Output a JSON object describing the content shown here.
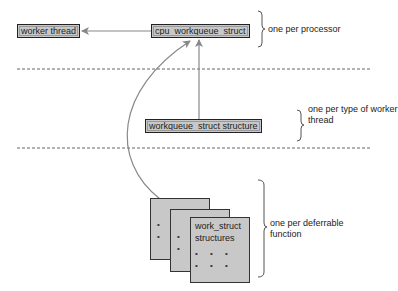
{
  "diagram": {
    "nodes": {
      "worker_thread": "worker thread",
      "cpu_workqueue_struct": "cpu_workqueue_struct",
      "workqueue_struct": "workqueue_struct structure",
      "work_struct_line1": "work_struct",
      "work_struct_line2": "structures"
    },
    "annotations": {
      "processor": "one per processor",
      "worker_type_line1": "one per type of worker",
      "worker_type_line2": "thread",
      "deferrable_line1": "one per deferrable",
      "deferrable_line2": "function"
    },
    "dots": "• •",
    "dots3": "• • •",
    "edges": [
      {
        "from": "cpu_workqueue_struct",
        "to": "worker_thread"
      },
      {
        "from": "workqueue_struct",
        "to": "cpu_workqueue_struct"
      },
      {
        "from": "work_struct",
        "to": "cpu_workqueue_struct"
      }
    ],
    "colors": {
      "box_fill": "#c8c8c8",
      "border": "#222222",
      "arrow": "#888888",
      "dashed": "#666666"
    }
  }
}
